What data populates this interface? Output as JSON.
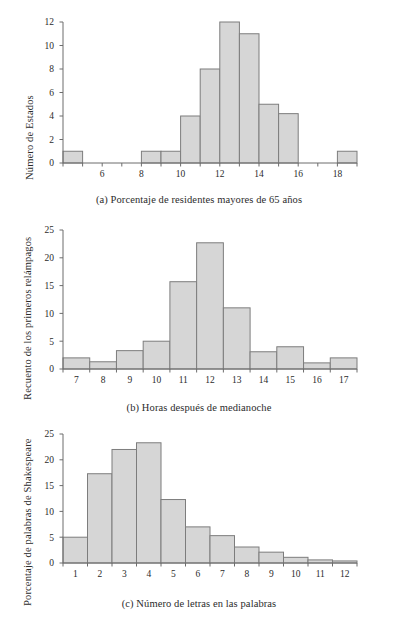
{
  "figure": {
    "background": "#ffffff",
    "bar_fill": "#d6d6d6",
    "bar_stroke": "#7d7d7d",
    "axis_color": "#6d6d6d",
    "text_color": "#2b2b2b"
  },
  "chart_data": [
    {
      "id": "panel-a",
      "type": "bar",
      "title": "",
      "caption": "(a) Porcentaje de residentes mayores de 65 años",
      "xlabel": "",
      "ylabel": "Número de Estados",
      "categories": [
        4,
        5,
        6,
        7,
        8,
        9,
        10,
        11,
        12,
        13,
        14,
        15,
        16,
        17,
        18
      ],
      "bin_starts": [
        4,
        5,
        6,
        7,
        8,
        9,
        10,
        11,
        12,
        13,
        14,
        15,
        16,
        17,
        18
      ],
      "bin_width": 1,
      "values": [
        1,
        0,
        0,
        0,
        1,
        1,
        4,
        8,
        12,
        11,
        5,
        4.2,
        0,
        0,
        1
      ],
      "xlim": [
        4,
        19
      ],
      "ylim": [
        0,
        12
      ],
      "xticks": [
        6,
        8,
        10,
        12,
        14,
        16,
        18
      ],
      "xticklabels": [
        "6",
        "8",
        "10",
        "12",
        "14",
        "16",
        "18"
      ],
      "yticks": [
        0,
        2,
        4,
        6,
        8,
        10,
        12
      ],
      "yticklabels": [
        "0",
        "2",
        "4",
        "6",
        "8",
        "10",
        "12"
      ],
      "grid": false,
      "legend": "none"
    },
    {
      "id": "panel-b",
      "type": "bar",
      "title": "",
      "caption": "(b) Horas después de medianoche",
      "xlabel": "",
      "ylabel": "Recuento de los primeros relámpagos",
      "categories": [
        7,
        8,
        9,
        10,
        11,
        12,
        13,
        14,
        15,
        16,
        17
      ],
      "bin_starts": [
        6.5,
        7.5,
        8.5,
        9.5,
        10.5,
        11.5,
        12.5,
        13.5,
        14.5,
        15.5,
        16.5
      ],
      "bin_width": 1,
      "values": [
        2,
        1.3,
        3.3,
        5,
        15.7,
        22.7,
        11,
        3.1,
        4,
        1.1,
        2
      ],
      "xlim": [
        6.5,
        17.5
      ],
      "ylim": [
        0,
        25
      ],
      "xticks": [
        7,
        8,
        9,
        10,
        11,
        12,
        13,
        14,
        15,
        16,
        17
      ],
      "xticklabels": [
        "7",
        "8",
        "9",
        "10",
        "11",
        "12",
        "13",
        "14",
        "15",
        "16",
        "17"
      ],
      "yticks": [
        0,
        5,
        10,
        15,
        20,
        25
      ],
      "yticklabels": [
        "0",
        "5",
        "10",
        "15",
        "20",
        "25"
      ],
      "grid": false,
      "legend": "none"
    },
    {
      "id": "panel-c",
      "type": "bar",
      "title": "",
      "caption": "(c) Número de letras en las palabras",
      "xlabel": "",
      "ylabel": "Porcentaje de palabras de Shakespeare",
      "categories": [
        1,
        2,
        3,
        4,
        5,
        6,
        7,
        8,
        9,
        10,
        11,
        12
      ],
      "bin_starts": [
        0.5,
        1.5,
        2.5,
        3.5,
        4.5,
        5.5,
        6.5,
        7.5,
        8.5,
        9.5,
        10.5,
        11.5
      ],
      "bin_width": 1,
      "values": [
        5,
        17.3,
        22,
        23.3,
        12.3,
        7,
        5.3,
        3.1,
        2.1,
        1.1,
        0.6,
        0.4
      ],
      "xlim": [
        0.5,
        12.5
      ],
      "ylim": [
        0,
        25
      ],
      "xticks": [
        1,
        2,
        3,
        4,
        5,
        6,
        7,
        8,
        9,
        10,
        11,
        12
      ],
      "xticklabels": [
        "1",
        "2",
        "3",
        "4",
        "5",
        "6",
        "7",
        "8",
        "9",
        "10",
        "11",
        "12"
      ],
      "yticks": [
        0,
        5,
        10,
        15,
        20,
        25
      ],
      "yticklabels": [
        "0",
        "5",
        "10",
        "15",
        "20",
        "25"
      ],
      "grid": false,
      "legend": "none"
    }
  ]
}
